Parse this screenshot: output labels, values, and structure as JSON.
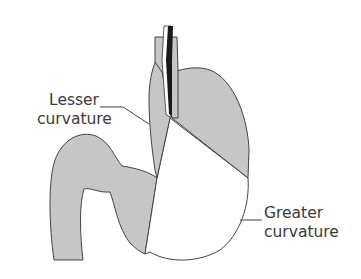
{
  "diagram": {
    "fill_color": "#c8c8c8",
    "stroke_color": "#3a3a3a",
    "labels": {
      "lesser": {
        "line1": "Lesser",
        "line2": "curvature"
      },
      "greater": {
        "line1": "Greater",
        "line2": "curvature"
      }
    }
  }
}
